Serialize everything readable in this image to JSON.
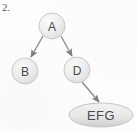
{
  "figure": {
    "label": "2.",
    "type": "tree-diagram",
    "background_color": "#fdfdfd",
    "node_fill_color": "#ededed",
    "node_stroke_color": "#c9c9c9",
    "text_color": "#4a4a4a",
    "edge_color": "#8a8a8a"
  },
  "nodes": [
    {
      "id": "A",
      "label": "A",
      "shape": "circle",
      "cx": 52,
      "cy": 26,
      "r": 13
    },
    {
      "id": "B",
      "label": "B",
      "shape": "circle",
      "cx": 25,
      "cy": 71,
      "r": 13
    },
    {
      "id": "D",
      "label": "D",
      "shape": "circle",
      "cx": 77,
      "cy": 70,
      "r": 13
    },
    {
      "id": "EFG",
      "label": "EFG",
      "shape": "ellipse",
      "cx": 101,
      "cy": 115,
      "rx": 32,
      "ry": 12
    }
  ],
  "edges": [
    {
      "from": "A",
      "to": "B",
      "arrow": true
    },
    {
      "from": "A",
      "to": "D",
      "arrow": true
    },
    {
      "from": "D",
      "to": "EFG",
      "arrow": true
    }
  ]
}
